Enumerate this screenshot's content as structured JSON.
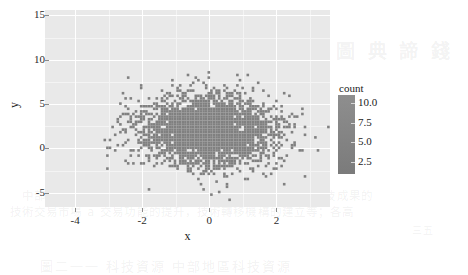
{
  "chart_data": {
    "type": "scatter",
    "title": "",
    "subtitle": "",
    "xlabel": "x",
    "ylabel": "y",
    "xlim": [
      -4.9,
      3.6
    ],
    "ylim": [
      -6.6,
      15.6
    ],
    "xticks": [
      "-4",
      "-2",
      "0",
      "2"
    ],
    "xtick_values": [
      -4,
      -2,
      0,
      2
    ],
    "yticks": [
      "15",
      "10",
      "5",
      "0",
      "-5"
    ],
    "ytick_values": [
      15,
      10,
      5,
      0,
      -5
    ],
    "grid": true,
    "grid_color": "#ffffff",
    "panel_background": "#e9e9e9",
    "point_color": "#808080",
    "legend": {
      "position": "right",
      "title": "count",
      "type": "continuous-colorbar",
      "ticks": [
        "10.0",
        "7.5",
        "5.0",
        "2.5"
      ],
      "tick_values": [
        10.0,
        7.5,
        5.0,
        2.5
      ],
      "range": [
        1.0,
        11.0
      ],
      "color_low": "#7b7b7b",
      "color_high": "#8e8e8e"
    },
    "distribution": {
      "n_points": 3000,
      "x_mean": 0.0,
      "x_sd": 1.0,
      "y_mean": 2.0,
      "y_sd": 2.0
    }
  },
  "background_bleed": {
    "top_block": "圖 典 諦 錢",
    "line_1": "中部地區科技工作人員數量分別為及研究計成果轉化：科技成果的",
    "line_2": "技術交易市場 a 交易功能的提升，技術轉移機構的建立等；各高",
    "line_3": "三五",
    "line_4": "圖二一一 科技資源 中部地區科技資源"
  }
}
